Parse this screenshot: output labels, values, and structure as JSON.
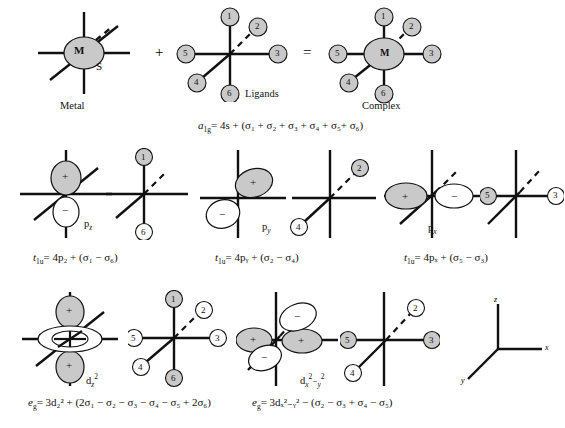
{
  "figure": {
    "colors": {
      "shaded_fill": "#c9c9c9",
      "unshaded_fill": "#ffffff",
      "stroke": "#111111",
      "background": "#ffffff"
    }
  },
  "row1": {
    "metal": {
      "center_label": "M",
      "orbital_label": "S",
      "caption": "Metal"
    },
    "operator_plus": "+",
    "operator_equals": "=",
    "ligands": {
      "caption": "Ligands",
      "numbers": [
        "1",
        "2",
        "3",
        "4",
        "5",
        "6"
      ]
    },
    "complex": {
      "center_label": "M",
      "caption": "Complex",
      "numbers": [
        "1",
        "2",
        "3",
        "4",
        "5",
        "6"
      ]
    },
    "equation": {
      "symmetry": "a",
      "symmetry_sub": "1g",
      "text": "= 4s + (σ₁ + σ₂ + σ₃ + σ₄ + σ₅+ σ₆)"
    }
  },
  "row2": {
    "pz": {
      "orbital_label": "p",
      "orbital_sub": "z",
      "lobe_top_sign": "+",
      "lobe_bottom_sign": "−",
      "ligand_numbers": [
        "1",
        "6"
      ],
      "equation_symbol": "t",
      "equation_sub": "1u",
      "equation_text": "= 4p₂ + (σ₁ −  σ₆)",
      "equation_plain": "t1u = 4pz + (σ1 − σ6)"
    },
    "py": {
      "orbital_label": "p",
      "orbital_sub": "y",
      "lobe_top_sign": "+",
      "lobe_bottom_sign": "−",
      "ligand_numbers": [
        "2",
        "4"
      ],
      "equation_symbol": "t",
      "equation_sub": "1u",
      "equation_text": "= 4pᵧ + (σ₂ −  σ₄)",
      "equation_plain": "t1u = 4py + (σ2 − σ4)"
    },
    "px": {
      "orbital_label": "p",
      "orbital_sub": "x",
      "lobe_left_sign": "+",
      "lobe_right_sign": "−",
      "ligand_numbers": [
        "5",
        "3"
      ],
      "equation_symbol": "t",
      "equation_sub": "1u",
      "equation_text": "= 4pₓ + (σ₅ −  σ₃)",
      "equation_plain": "t1u = 4px + (σ5 − σ3)"
    }
  },
  "row3": {
    "dz2": {
      "orbital_label": "d",
      "orbital_sub": "z",
      "orbital_sup": "2",
      "lobe_top_sign": "+",
      "lobe_bottom_sign": "+",
      "torus_sign": "−",
      "ligand_numbers": [
        "1",
        "2",
        "3",
        "4",
        "5",
        "6"
      ],
      "equation_symbol": "e",
      "equation_sub": "g",
      "equation_text": "= 3d₂² + (2σ₁ − σ₂ − σ₃ − σ₄ − σ₅ + 2σ₆)",
      "equation_plain": "eg = 3dz2 + (2σ1 − σ2 − σ3 − σ4 − σ5 + 2σ6)"
    },
    "dx2y2": {
      "orbital_label": "d",
      "orbital_sub_x": "x",
      "orbital_sup_x": "2",
      "orbital_sub_y": "y",
      "orbital_sup_y": "2",
      "lobe_left_sign": "+",
      "lobe_right_sign": "+",
      "lobe_upper_sign": "−",
      "lobe_lower_sign": "−",
      "ligand_numbers": [
        "2",
        "3",
        "4",
        "5"
      ],
      "equation_symbol": "e",
      "equation_sub": "g",
      "equation_text": "= 3dₓ²₋ᵧ² − (σ₂ − σ₃ + σ₄ − σ₅)",
      "equation_plain": "eg = 3dx2-y2 − (σ2 − σ3 + σ4 − σ5)"
    },
    "axes": {
      "z": "z",
      "x": "x",
      "y": "y"
    }
  }
}
